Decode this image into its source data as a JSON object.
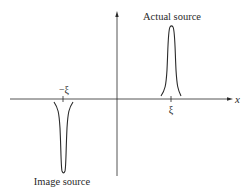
{
  "diagram": {
    "axis_label_x": "x",
    "tick_positive": "ξ",
    "tick_negative": "−ξ",
    "label_actual": "Actual source",
    "label_image": "Image source",
    "line_color": "#2a2a2a"
  }
}
